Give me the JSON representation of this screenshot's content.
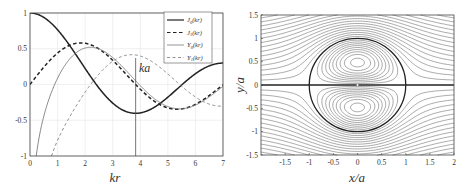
{
  "chart_data": [
    {
      "type": "line",
      "title": "",
      "xlabel": "kr",
      "ylabel": "",
      "xlim": [
        0,
        7
      ],
      "ylim": [
        -1,
        1
      ],
      "xticks": [
        "0",
        "1",
        "2",
        "3",
        "4",
        "5",
        "6",
        "7"
      ],
      "yticks": [
        "1",
        "0.5",
        "0",
        "-0.5",
        "-1"
      ],
      "grid": true,
      "legend_position": "upper right",
      "x": [
        0,
        0.5,
        1,
        1.5,
        2,
        2.5,
        3,
        3.5,
        4,
        4.5,
        5,
        5.5,
        6,
        6.5,
        7
      ],
      "series": [
        {
          "name": "J0(kr)",
          "style": "thick solid",
          "color": "#222222",
          "values": [
            1,
            0.9385,
            0.7652,
            0.5118,
            0.2239,
            -0.0484,
            -0.2601,
            -0.3801,
            -0.3971,
            -0.3205,
            -0.1776,
            -0.0068,
            0.1506,
            0.2601,
            0.3001
          ]
        },
        {
          "name": "J1(kr)",
          "style": "thick dashed",
          "color": "#222222",
          "values": [
            0,
            0.2423,
            0.4401,
            0.5579,
            0.5767,
            0.4971,
            0.3391,
            0.1374,
            -0.066,
            -0.2311,
            -0.3276,
            -0.3414,
            -0.2767,
            -0.1538,
            -0.0047
          ]
        },
        {
          "name": "Y0(kr)",
          "style": "thin solid",
          "color": "#777777",
          "values": [
            null,
            -0.4445,
            0.0883,
            0.3824,
            0.5104,
            0.4981,
            0.3769,
            0.189,
            -0.0169,
            -0.1947,
            -0.3085,
            -0.3395,
            -0.2882,
            -0.1732,
            -0.0259
          ]
        },
        {
          "name": "Y1(kr)",
          "style": "thin dashed",
          "color": "#777777",
          "values": [
            null,
            -1.4715,
            -0.7812,
            -0.4123,
            -0.107,
            0.1459,
            0.3247,
            0.4102,
            0.3979,
            0.301,
            0.1479,
            -0.0238,
            -0.175,
            -0.2741,
            -0.3027
          ]
        }
      ],
      "annotations": [
        {
          "text": "ka",
          "x": 3.8317,
          "note": "vertical line at first zero of J1"
        }
      ],
      "legend": [
        {
          "label": "J",
          "sub": "0",
          "arg": "(kr)"
        },
        {
          "label": "J",
          "sub": "1",
          "arg": "(kr)"
        },
        {
          "label": "Y",
          "sub": "0",
          "arg": "(kr)"
        },
        {
          "label": "Y",
          "sub": "1",
          "arg": "(kr)"
        }
      ]
    },
    {
      "type": "contour",
      "title": "",
      "xlabel": "x/a",
      "ylabel": "y/a",
      "xlim": [
        -2,
        2
      ],
      "ylim": [
        -1.5,
        1.5
      ],
      "xticks": [
        "-1.5",
        "-1",
        "-0.5",
        "0",
        "0.5",
        "1",
        "1.5",
        "2"
      ],
      "yticks": [
        "1.5",
        "1",
        "0.5",
        "0",
        "-0.5",
        "-1",
        "-1.5"
      ],
      "description": "Streamlines of Lamb-Chaplygin dipole; circle radius a=1, ka=3.8317",
      "ka": 3.8317,
      "level_step": 0.08
    }
  ],
  "labels": {
    "left_xlabel": "kr",
    "right_xlabel": "x/a",
    "right_ylabel": "y/a",
    "annotation": "ka"
  }
}
